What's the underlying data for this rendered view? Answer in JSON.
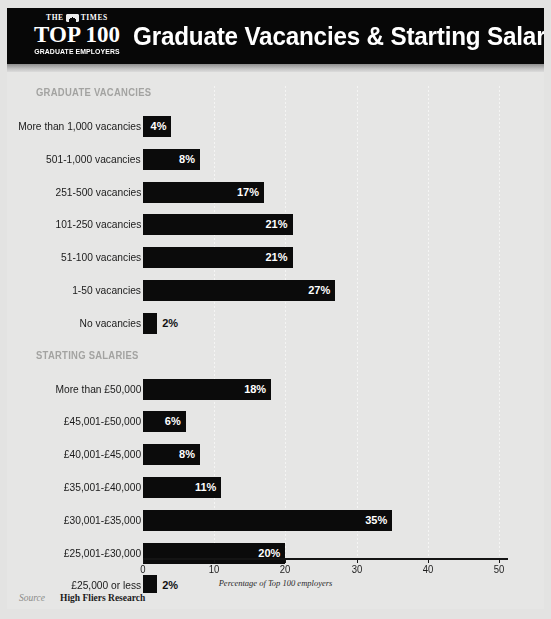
{
  "header": {
    "masthead_the": "THE",
    "masthead_times": "TIMES",
    "logo_main": "TOP 100",
    "logo_sub": "GRADUATE EMPLOYERS",
    "title": "Graduate Vacancies & Starting Salaries in 2025",
    "bg_color": "#070707",
    "text_color": "#ffffff"
  },
  "footer": {
    "source_word": "Source",
    "source_name": "High Fliers Research"
  },
  "chart_data": {
    "type": "bar",
    "orientation": "horizontal",
    "title": "Graduate Vacancies & Starting Salaries in 2025",
    "xlabel": "Percentage of Top 100 employers",
    "ylabel": "",
    "xlim": [
      0,
      50
    ],
    "xticks": [
      0,
      10,
      20,
      30,
      40,
      50
    ],
    "xticklabels": [
      "0",
      "10",
      "20",
      "30",
      "40",
      "50"
    ],
    "grid": "vertical-dotted",
    "legend": "none",
    "bar_color": "#0b0b0b",
    "sections": [
      {
        "heading": "GRADUATE VACANCIES",
        "categories": [
          "More than 1,000 vacancies",
          "501-1,000 vacancies",
          "251-500 vacancies",
          "101-250 vacancies",
          "51-100 vacancies",
          "1-50 vacancies",
          "No vacancies"
        ],
        "values": [
          4,
          8,
          17,
          21,
          21,
          27,
          2
        ],
        "labels": [
          "4%",
          "8%",
          "17%",
          "21%",
          "21%",
          "27%",
          "2%"
        ]
      },
      {
        "heading": "STARTING SALARIES",
        "categories": [
          "More than £50,000",
          "£45,001-£50,000",
          "£40,001-£45,000",
          "£35,001-£40,000",
          "£30,001-£35,000",
          "£25,001-£30,000",
          "£25,000 or less"
        ],
        "values": [
          18,
          6,
          8,
          11,
          35,
          20,
          2
        ],
        "labels": [
          "18%",
          "6%",
          "8%",
          "11%",
          "35%",
          "20%",
          "2%"
        ]
      }
    ]
  }
}
